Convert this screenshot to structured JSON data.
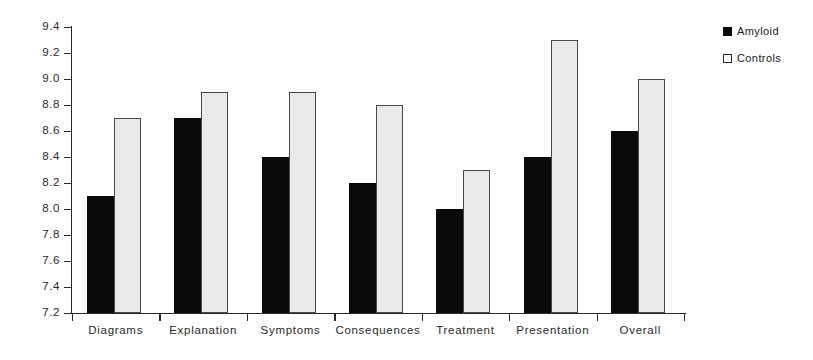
{
  "chart_data": {
    "type": "bar",
    "title": "",
    "subtitle": "",
    "xlabel": "",
    "ylabel": "",
    "categories": [
      "Diagrams",
      "Explanation",
      "Symptoms",
      "Consequences",
      "Treatment",
      "Presentation",
      "Overall"
    ],
    "series": [
      {
        "name": "Amyloid",
        "color": "#0a0a0a",
        "values": [
          8.1,
          8.7,
          8.4,
          8.2,
          8.0,
          8.4,
          8.6
        ]
      },
      {
        "name": "Controls",
        "color": "#e9e9e9",
        "values": [
          8.7,
          8.9,
          8.9,
          8.8,
          8.3,
          9.3,
          9.0
        ]
      }
    ],
    "ylim": [
      7.2,
      9.4
    ],
    "ytick_step": 0.2,
    "ytick_labels": [
      "9.4",
      "9.2",
      "9.0",
      "8.8",
      "8.6",
      "8.4",
      "8.2",
      "8.0",
      "7.8",
      "7.6",
      "7.4",
      "7.2"
    ],
    "grid": false,
    "legend_position": "top-right"
  },
  "legend": {
    "items": [
      {
        "label": "Amyloid",
        "swatch": "filled-black-square"
      },
      {
        "label": "Controls",
        "swatch": "outlined-white-square"
      }
    ]
  }
}
